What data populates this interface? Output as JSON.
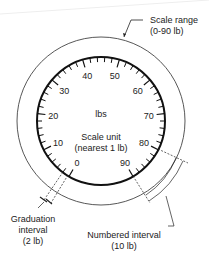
{
  "diagram": {
    "center_label": "lbs",
    "scale_unit_label": "Scale unit",
    "scale_unit_sub": "(nearest 1 lb)",
    "scale_range_label": "Scale range",
    "scale_range_sub": "(0-90 lb)",
    "graduation_label": "Graduation",
    "graduation_label2": "interval",
    "graduation_sub": "(2 lb)",
    "numbered_label": "Numbered interval",
    "numbered_sub": "(10 lb)",
    "dial": {
      "min": 0,
      "max": 90,
      "graduation": 2,
      "numbered": 10,
      "numbers": [
        "0",
        "10",
        "20",
        "30",
        "40",
        "50",
        "60",
        "70",
        "80",
        "90"
      ],
      "start_angle_deg": -150,
      "end_angle_deg": 150
    },
    "colors": {
      "ink": "#1a1a1a"
    }
  }
}
